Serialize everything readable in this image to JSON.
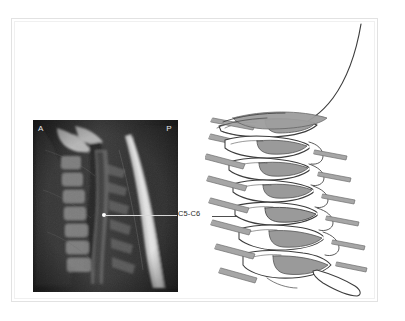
{
  "figure": {
    "domain_label": "cervical-spine-mri-and-illustration",
    "background_color": "#ffffff",
    "frame_color": "#e2e2e2"
  },
  "mri": {
    "orientation_anterior": "A",
    "orientation_posterior": "P",
    "modality_description": "sagittal cervical spine MRI",
    "background_color": "#1b1b1b",
    "marker_color": "#ffffff",
    "marker_level": "C5-C6"
  },
  "annotation": {
    "label": "C5-C6",
    "label_color": "#2b2b2b",
    "arrow_color": "#3a3a3a",
    "leader_line_color": "#d8d8d8"
  },
  "illustration": {
    "description": "lateral view line drawing of cervical spine with occiput",
    "outline_color": "#3d3d3d",
    "disc_shade_color": "#9a9a9a",
    "nerve_shade_color": "#a8a8a8",
    "bone_fill_color": "#ffffff",
    "levels": [
      {
        "name": "occiput",
        "type": "skull-base"
      },
      {
        "name": "C1",
        "type": "atlas"
      },
      {
        "name": "C2",
        "type": "axis"
      },
      {
        "name": "C3",
        "type": "vertebra"
      },
      {
        "name": "C4",
        "type": "vertebra"
      },
      {
        "name": "C5",
        "type": "vertebra"
      },
      {
        "name": "C6",
        "type": "vertebra"
      },
      {
        "name": "C7",
        "type": "vertebra"
      }
    ]
  }
}
